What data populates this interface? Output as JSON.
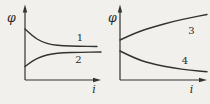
{
  "figure": {
    "background_color": "#f1f0ec",
    "line_color": "#34322f",
    "text_color": "#2b2a27"
  },
  "chart_data": [
    {
      "type": "line",
      "title": "",
      "xlabel": "i",
      "ylabel": "φ",
      "axes_numeric": false,
      "grid": false,
      "series": [
        {
          "name": "1",
          "trend": "decreasing toward horizontal asymptote",
          "points": [
            [
              25,
              29
            ],
            [
              33,
              36.5
            ],
            [
              42,
              42
            ],
            [
              52,
              44.8
            ],
            [
              63,
              45.8
            ],
            [
              78,
              46.3
            ],
            [
              97,
              46.5
            ]
          ],
          "label_x": 80,
          "label_y": 40.5
        },
        {
          "name": "2",
          "trend": "increasing toward horizontal asymptote",
          "points": [
            [
              25,
              66.5
            ],
            [
              33,
              60.5
            ],
            [
              42,
              56.3
            ],
            [
              52,
              53.8
            ],
            [
              63,
              52.7
            ],
            [
              80,
              52.2
            ],
            [
              101,
              52
            ]
          ],
          "label_x": 78.5,
          "label_y": 62.5
        }
      ]
    },
    {
      "type": "line",
      "title": "",
      "xlabel": "i",
      "ylabel": "φ",
      "axes_numeric": false,
      "grid": false,
      "series": [
        {
          "name": "3",
          "trend": "increasing, concave down",
          "points": [
            [
              15,
              40
            ],
            [
              32,
              32
            ],
            [
              50,
              26.5
            ],
            [
              68,
              21.5
            ],
            [
              85,
              17.8
            ],
            [
              102,
              14.5
            ]
          ],
          "label_x": 86.5,
          "label_y": 34
        },
        {
          "name": "4",
          "trend": "decreasing, concave up",
          "points": [
            [
              15,
              51
            ],
            [
              32,
              59.5
            ],
            [
              50,
              64.5
            ],
            [
              68,
              68
            ],
            [
              85,
              70.3
            ],
            [
              102,
              71.8
            ]
          ],
          "label_x": 80,
          "label_y": 64
        }
      ]
    }
  ]
}
